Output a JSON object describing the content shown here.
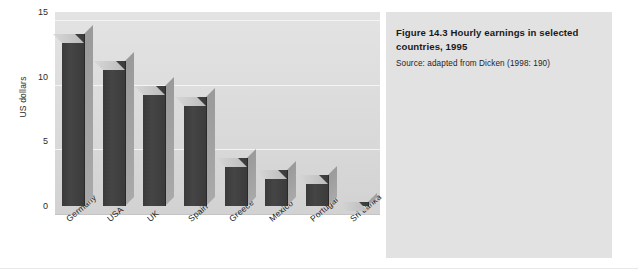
{
  "figure": {
    "caption_title": "Figure 14.3  Hourly earnings in selected countries, 1995",
    "caption_source": "Source: adapted from Dicken (1998: 190)"
  },
  "colors": {
    "bar_front": "#3f3f3f",
    "bar_top": "#c8c8c8",
    "bar_side": "#a2a2a2",
    "plot_background": "#dcdcdc",
    "caption_background": "#e2e2e2",
    "gridline": "#f4f4f4",
    "text": "#1c1c1c"
  },
  "chart_data": {
    "type": "bar",
    "title": "Figure 14.3  Hourly earnings in selected countries, 1995",
    "subtitle": "Source: adapted from Dicken (1998: 190)",
    "xlabel": "",
    "ylabel": "US dollars",
    "categories": [
      "Germany",
      "USA",
      "UK",
      "Spain",
      "Greece",
      "Mexico",
      "Portugal",
      "Sri Lanka"
    ],
    "values": [
      13.3,
      11.2,
      9.3,
      8.4,
      3.7,
      2.8,
      2.4,
      0.3
    ],
    "ylim": [
      0,
      15
    ],
    "yticks": [
      0,
      5,
      10,
      15
    ],
    "ytick_labels": [
      "0",
      "5",
      "10",
      "15"
    ],
    "grid": true,
    "legend": false,
    "style": "3d-column",
    "units": "US dollars per hour"
  }
}
